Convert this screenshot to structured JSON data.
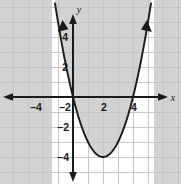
{
  "chart_data": {
    "type": "line",
    "title": "",
    "xlabel": "x",
    "ylabel": "y",
    "xlim": [
      -5.1,
      6.3
    ],
    "ylim": [
      -5.6,
      5.7
    ],
    "grid": true,
    "grid_step": 1,
    "legend": "none",
    "curves": [
      {
        "name": "parabola",
        "equation": "y = x^2 - 4x",
        "vertex": [
          2,
          -4
        ],
        "roots": [
          0,
          4
        ],
        "opens": "up",
        "color": "#1a1a1a",
        "arrow_ends": "both",
        "x": [
          -0.95,
          -0.75,
          -0.5,
          -0.25,
          0,
          0.5,
          1,
          1.5,
          2,
          2.5,
          3,
          3.5,
          4,
          4.25,
          4.5,
          4.75,
          4.95
        ],
        "y": [
          4.7,
          3.56,
          2.25,
          1.06,
          0,
          -1.75,
          -3,
          -3.75,
          -4,
          -3.75,
          -3,
          -1.75,
          0,
          1.06,
          2.25,
          3.56,
          4.7
        ]
      }
    ],
    "shaded_region": {
      "name": "region-above-parabola",
      "description": "y >= x^2 - 4x",
      "fill": "#d2d2d2",
      "opacity": 1
    },
    "x_ticks": [
      -4,
      -2,
      2,
      4
    ],
    "y_ticks": [
      4,
      2,
      -2,
      -4
    ],
    "x_tick_labels": [
      "–4",
      "–2",
      "2",
      "4"
    ],
    "y_tick_labels": [
      "4",
      "2",
      "–2",
      "–4"
    ],
    "axis_color": "#1a1a1a",
    "grid_color": "#c3c3c8",
    "background": "#ffffff"
  },
  "labels": {
    "x_axis": "x",
    "y_axis": "y",
    "x_neg4": "–4",
    "x_neg2": "–2",
    "x_pos2": "2",
    "x_pos4": "4",
    "y_pos4": "4",
    "y_pos2": "2",
    "y_neg2": "–2",
    "y_neg4": "–4"
  }
}
